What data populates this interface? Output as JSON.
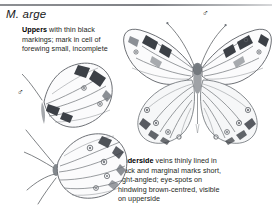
{
  "page": {
    "species_heading": "M. arge",
    "divider": "horizontal-rule"
  },
  "notes": [
    {
      "id": "uppers",
      "lead": "Uppers",
      "body": " with thin black markings; mark in cell of forewing small, incomplete"
    },
    {
      "id": "underside",
      "lead": "Underside",
      "body": " veins thinly lined in black and marginal marks short, right-angled; eye-spots on hindwing brown-centred, visible on upperside"
    }
  ],
  "sex_symbols": [
    {
      "id": "left",
      "glyph": "♂",
      "label": "male-symbol"
    },
    {
      "id": "right",
      "glyph": "♂",
      "label": "male-symbol"
    }
  ],
  "illustrations": [
    {
      "id": "underside-main",
      "label": "butterfly-underside-spread",
      "view": "underside",
      "orientation": "spread-wings"
    },
    {
      "id": "upper-left",
      "label": "butterfly-upperside-partial",
      "view": "upperside",
      "orientation": "angled-folded"
    },
    {
      "id": "underside-left",
      "label": "butterfly-underside-partial",
      "view": "underside",
      "orientation": "angled-folded"
    }
  ],
  "colors": {
    "rule": "#8d8f93",
    "text": "#1e1f22",
    "heading": "#17181a",
    "wing_outline": "#5d6166",
    "wing_fill": "#fbfbfc",
    "markings": "#3c4046",
    "page_background": "#ffffff"
  }
}
